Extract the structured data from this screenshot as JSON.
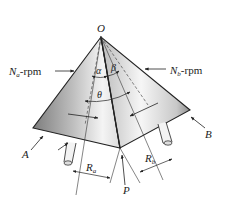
{
  "figure": {
    "type": "bevel-gear-pitch-cones-diagram",
    "labels": {
      "apex": "O",
      "pitch_point": "P",
      "gear_a": "A",
      "gear_b": "B",
      "speed_a_sym": "N",
      "speed_a_sub": "a",
      "speed_a_unit": "-rpm",
      "speed_b_sym": "N",
      "speed_b_sub": "b",
      "speed_b_unit": "-rpm",
      "angle_alpha": "α",
      "angle_beta": "β",
      "angle_theta": "θ",
      "radius_a_sym": "R",
      "radius_a_sub": "a",
      "radius_b_sym": "R",
      "radius_b_sub": "b"
    },
    "colors": {
      "line": "#222222",
      "face_light": "#f2f2f2",
      "face_dark": "#8a8a8a",
      "background": "#ffffff"
    }
  }
}
